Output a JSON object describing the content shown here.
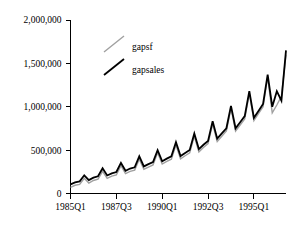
{
  "chart_data": {
    "type": "line",
    "title": "",
    "subtitle": "",
    "xlabel": "",
    "ylabel": "",
    "grid": false,
    "legend_position": "top-center-inside",
    "xlim": [
      0,
      47
    ],
    "ylim": [
      0,
      2000000
    ],
    "y_ticks": [
      0,
      500000,
      1000000,
      1500000,
      2000000
    ],
    "y_tick_labels": [
      "0",
      "500,000",
      "1,000,000",
      "1,500,000",
      "2,000,000"
    ],
    "x_ticks": [
      0,
      10,
      20,
      30,
      40
    ],
    "x_tick_labels": [
      "1985Q1",
      "1987Q3",
      "1990Q1",
      "1992Q3",
      "1995Q1"
    ],
    "x": [
      0,
      1,
      2,
      3,
      4,
      5,
      6,
      7,
      8,
      9,
      10,
      11,
      12,
      13,
      14,
      15,
      16,
      17,
      18,
      19,
      20,
      21,
      22,
      23,
      24,
      25,
      26,
      27,
      28,
      29,
      30,
      31,
      32,
      33,
      34,
      35,
      36,
      37,
      38,
      39,
      40,
      41,
      42,
      43,
      44,
      45,
      46,
      47
    ],
    "x_quarter_labels": [
      "1985Q1",
      "1985Q2",
      "1985Q3",
      "1985Q4",
      "1986Q1",
      "1986Q2",
      "1986Q3",
      "1986Q4",
      "1987Q1",
      "1987Q2",
      "1987Q3",
      "1987Q4",
      "1988Q1",
      "1988Q2",
      "1988Q3",
      "1988Q4",
      "1989Q1",
      "1989Q2",
      "1989Q3",
      "1989Q4",
      "1990Q1",
      "1990Q2",
      "1990Q3",
      "1990Q4",
      "1991Q1",
      "1991Q2",
      "1991Q3",
      "1991Q4",
      "1992Q1",
      "1992Q2",
      "1992Q3",
      "1992Q4",
      "1993Q1",
      "1993Q2",
      "1993Q3",
      "1993Q4",
      "1994Q1",
      "1994Q2",
      "1994Q3",
      "1994Q4",
      "1995Q1",
      "1995Q2",
      "1995Q3",
      "1995Q4",
      "1996Q1",
      "1996Q2",
      "1996Q3",
      "1996Q4"
    ],
    "series": [
      {
        "name": "gapsf",
        "color": "#A0A0A0",
        "width": 1.4,
        "values": [
          70000,
          95000,
          105000,
          175000,
          120000,
          150000,
          165000,
          255000,
          175000,
          200000,
          215000,
          320000,
          230000,
          255000,
          270000,
          395000,
          280000,
          305000,
          330000,
          470000,
          340000,
          370000,
          395000,
          560000,
          400000,
          435000,
          470000,
          660000,
          480000,
          530000,
          575000,
          800000,
          600000,
          660000,
          720000,
          980000,
          720000,
          790000,
          860000,
          1150000,
          840000,
          920000,
          1000000,
          1340000,
          930000,
          1020000,
          1120000,
          1600000
        ]
      },
      {
        "name": "gapsales",
        "color": "#000000",
        "width": 1.8,
        "values": [
          105000,
          128000,
          140000,
          210000,
          155000,
          182000,
          198000,
          290000,
          208000,
          232000,
          248000,
          352000,
          262000,
          288000,
          302000,
          428000,
          312000,
          338000,
          362000,
          500000,
          372000,
          402000,
          428000,
          592000,
          432000,
          468000,
          502000,
          692000,
          512000,
          562000,
          606000,
          832000,
          632000,
          692000,
          752000,
          1010000,
          752000,
          822000,
          892000,
          1180000,
          872000,
          952000,
          1032000,
          1370000,
          1000000,
          1180000,
          1070000,
          1650000
        ]
      }
    ],
    "legend": [
      {
        "label": "gapsf",
        "color": "#A0A0A0"
      },
      {
        "label": "gapsales",
        "color": "#000000"
      }
    ]
  },
  "legend": {
    "item0_label": "gapsf",
    "item1_label": "gapsales"
  },
  "y_axis": {
    "label0": "0",
    "label1": "500,000",
    "label2": "1,000,000",
    "label3": "1,500,000",
    "label4": "2,000,000"
  },
  "x_axis": {
    "label0": "1985Q1",
    "label1": "1987Q3",
    "label2": "1990Q1",
    "label3": "1992Q3",
    "label4": "1995Q1"
  },
  "colors": {
    "axis": "#000000",
    "background": "#ffffff",
    "series_gapsf": "#A0A0A0",
    "series_gapsales": "#000000"
  }
}
